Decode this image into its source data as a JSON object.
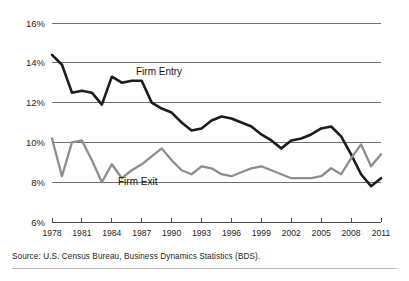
{
  "source_note": "Source: U.S. Census Bureau, Business Dynamics Statistics (BDS).",
  "annotations": {
    "firm_entry": "Firm Entry",
    "firm_exit": "Firm Exit"
  },
  "colors": {
    "firm_entry": "#1c1c1c",
    "firm_exit": "#8d8d8d",
    "gridline": "#6f6f6f",
    "axis": "#4a4a4a",
    "background": "#ffffff",
    "text": "#1d1d1d"
  },
  "chart_data": {
    "type": "line",
    "title": "",
    "subtitle": "",
    "xlabel": "",
    "ylabel": "",
    "grid": true,
    "legend_position": "inline-annotation",
    "ylim": [
      6,
      16
    ],
    "xlim": [
      1978,
      2011
    ],
    "ytick_labels": [
      "16%",
      "14%",
      "12%",
      "10%",
      "8%",
      "6%"
    ],
    "ytick_values": [
      16,
      14,
      12,
      10,
      8,
      6
    ],
    "xtick_labels": [
      "1978",
      "1981",
      "1984",
      "1987",
      "1990",
      "1993",
      "1996",
      "1999",
      "2002",
      "2005",
      "2008",
      "2011"
    ],
    "xtick_values": [
      1978,
      1981,
      1984,
      1987,
      1990,
      1993,
      1996,
      1999,
      2002,
      2005,
      2008,
      2011
    ],
    "x": [
      1978,
      1979,
      1980,
      1981,
      1982,
      1983,
      1984,
      1985,
      1986,
      1987,
      1988,
      1989,
      1990,
      1991,
      1992,
      1993,
      1994,
      1995,
      1996,
      1997,
      1998,
      1999,
      2000,
      2001,
      2002,
      2003,
      2004,
      2005,
      2006,
      2007,
      2008,
      2009,
      2010,
      2011
    ],
    "series": [
      {
        "name": "Firm Entry",
        "color": "#1c1c1c",
        "values": [
          14.4,
          13.9,
          12.5,
          12.6,
          12.5,
          11.9,
          13.3,
          13.0,
          13.1,
          13.1,
          12.0,
          11.7,
          11.5,
          11.0,
          10.6,
          10.7,
          11.1,
          11.3,
          11.2,
          11.0,
          10.8,
          10.4,
          10.1,
          9.7,
          10.1,
          10.2,
          10.4,
          10.7,
          10.8,
          10.3,
          9.4,
          8.4,
          7.8,
          8.2
        ]
      },
      {
        "name": "Firm Exit",
        "color": "#8d8d8d",
        "values": [
          10.2,
          8.3,
          10.0,
          10.1,
          9.1,
          8.0,
          8.9,
          8.2,
          8.6,
          8.9,
          9.3,
          9.7,
          9.1,
          8.6,
          8.4,
          8.8,
          8.7,
          8.4,
          8.3,
          8.5,
          8.7,
          8.8,
          8.6,
          8.4,
          8.2,
          8.2,
          8.2,
          8.3,
          8.7,
          8.4,
          9.2,
          9.9,
          8.8,
          9.4
        ]
      }
    ]
  }
}
